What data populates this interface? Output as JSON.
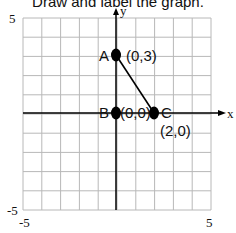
{
  "title": "Draw and label the graph.",
  "axes": {
    "x_label": "x",
    "y_label": "y",
    "y_top_tick": "5",
    "y_bottom_tick": "-5",
    "x_left_tick": "-5",
    "x_right_tick": "5"
  },
  "points": [
    {
      "name": "A",
      "coord_label": "(0,3)",
      "x": 0,
      "y": 3
    },
    {
      "name": "B",
      "coord_label": "(0,0)",
      "x": 0,
      "y": 0
    },
    {
      "name": "C",
      "coord_label": "(2,0)",
      "x": 2,
      "y": 0
    }
  ],
  "chart_data": {
    "type": "scatter",
    "title": "Draw and label the graph.",
    "xlabel": "x",
    "ylabel": "y",
    "xlim": [
      -5,
      5
    ],
    "ylim": [
      -5,
      5
    ],
    "grid": true,
    "tick_labels": {
      "x": [
        "-5",
        "5"
      ],
      "y": [
        "-5",
        "5"
      ]
    },
    "series": [
      {
        "name": "points",
        "x": [
          0,
          0,
          2
        ],
        "y": [
          3,
          0,
          0
        ],
        "labels": [
          "A (0,3)",
          "B (0,0)",
          "C (2,0)"
        ]
      },
      {
        "name": "segment AC",
        "type": "line",
        "x": [
          0,
          2
        ],
        "y": [
          3,
          0
        ]
      }
    ]
  }
}
